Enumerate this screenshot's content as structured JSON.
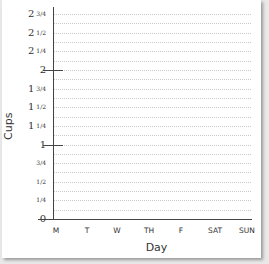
{
  "chart_data": {
    "type": "bar",
    "title": "",
    "xlabel": "Day",
    "ylabel": "Cups",
    "categories": [
      "M",
      "T",
      "W",
      "TH",
      "F",
      "SAT",
      "SUN"
    ],
    "values": [
      null,
      null,
      null,
      null,
      null,
      null,
      null
    ],
    "ylim": [
      0,
      2.75
    ],
    "yticks": [
      {
        "value": 0,
        "label": "0"
      },
      {
        "value": 0.25,
        "label": "¼"
      },
      {
        "value": 0.5,
        "label": "½"
      },
      {
        "value": 0.75,
        "label": "¾"
      },
      {
        "value": 1,
        "label": "1"
      },
      {
        "value": 1.25,
        "label": "1¼"
      },
      {
        "value": 1.5,
        "label": "1½"
      },
      {
        "value": 1.75,
        "label": "1¾"
      },
      {
        "value": 2,
        "label": "2"
      },
      {
        "value": 2.25,
        "label": "2¼"
      },
      {
        "value": 2.5,
        "label": "2½"
      },
      {
        "value": 2.75,
        "label": "2¾"
      }
    ],
    "grid": true,
    "grid_interval": 0.125,
    "legend": null,
    "note": "Blank bar graph template; no data plotted."
  },
  "axis": {
    "x_title": "Day",
    "y_title": "Cups",
    "x_labels": [
      "M",
      "T",
      "W",
      "TH",
      "F",
      "SAT",
      "SUN"
    ],
    "y_labels": [
      {
        "whole": "0",
        "frac": ""
      },
      {
        "whole": "",
        "frac": "1/4"
      },
      {
        "whole": "",
        "frac": "1/2"
      },
      {
        "whole": "",
        "frac": "3/4"
      },
      {
        "whole": "1",
        "frac": ""
      },
      {
        "whole": "1",
        "frac": "1/4"
      },
      {
        "whole": "1",
        "frac": "1/2"
      },
      {
        "whole": "1",
        "frac": "3/4"
      },
      {
        "whole": "2",
        "frac": ""
      },
      {
        "whole": "2",
        "frac": "1/4"
      },
      {
        "whole": "2",
        "frac": "1/2"
      },
      {
        "whole": "2",
        "frac": "3/4"
      }
    ]
  },
  "colors": {
    "axis": "#444444",
    "grid": "#c9c9c9",
    "background": "#ffffff",
    "page": "#e9e9e9"
  }
}
